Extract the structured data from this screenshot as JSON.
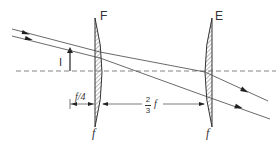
{
  "diagram": {
    "type": "optical lens diagram (eyepiece)",
    "lenses": [
      {
        "id": "field-lens",
        "label": "F",
        "focal_label": "f"
      },
      {
        "id": "eye-lens",
        "label": "E",
        "focal_label": "f"
      }
    ],
    "image_label": "I",
    "dimensions": {
      "image_to_field_lens": "f/4",
      "lens_separation_num": "2",
      "lens_separation_den": "3",
      "lens_separation_var": "f"
    },
    "colors": {
      "line": "#333333",
      "hatch": "#555555",
      "background": "#ffffff"
    }
  }
}
